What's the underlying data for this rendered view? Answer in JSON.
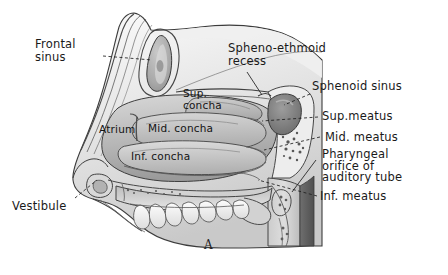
{
  "figure": {
    "caption": "A",
    "background_color": "#ffffff",
    "ink_color": "#1a1a1a"
  },
  "labels": {
    "frontal_sinus": "Frontal\nsinus",
    "spheno_ethmoid_recess": "Spheno-ethmoid\nrecess",
    "sphenoid_sinus": "Sphenoid sinus",
    "sup_meatus": "Sup.meatus",
    "mid_meatus": "Mid. meatus",
    "pharyngeal_orifice": "Pharyngeal\norifice of\nauditory tube",
    "inf_meatus": "Inf. meatus",
    "sup_concha": "Sup.\nconcha",
    "mid_concha": "Mid. concha",
    "inf_concha": "Inf. concha",
    "atrium": "Atrium",
    "vestibule": "Vestibule"
  }
}
